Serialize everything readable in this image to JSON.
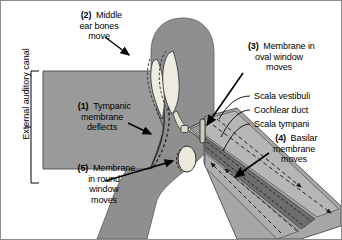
{
  "figure": {
    "background": "#ffffff",
    "border_color": "#8d8d8d",
    "width": 342,
    "height": 240
  },
  "colors": {
    "head_gray": "#8f8f8f",
    "canal_gray": "#9a9a9a",
    "bone_cream": "#e8e5da",
    "cochlea_light": "#9e9e9e",
    "cochlear_duct_dark": "#6e6e6e",
    "scala_mid": "#b4b4b4",
    "outline": "#3a3a3a",
    "text": "#000000"
  },
  "bracket": {
    "label": "External auditory canal",
    "orientation": "vertical"
  },
  "callouts": [
    {
      "id": "tympanic-membrane",
      "number": "(1)",
      "lines": [
        "Tympanic",
        "membrane",
        "deflects"
      ],
      "align": "center"
    },
    {
      "id": "middle-ear-bones",
      "number": "(2)",
      "lines": [
        "Middle",
        "ear bones",
        "move"
      ],
      "align": "center"
    },
    {
      "id": "oval-window",
      "number": "(3)",
      "lines": [
        "Membrane in",
        "oval window",
        "moves"
      ],
      "align": "center"
    },
    {
      "id": "basilar-membrane",
      "number": "(4)",
      "lines": [
        "Basilar",
        "membrane",
        "moves"
      ],
      "align": "center"
    },
    {
      "id": "round-window",
      "number": "(5)",
      "lines": [
        "Membrane",
        "in round",
        "window",
        "moves"
      ],
      "align": "center"
    }
  ],
  "leader_labels": [
    {
      "id": "scala-vestibuli",
      "text": "Scala vestibuli"
    },
    {
      "id": "cochlear-duct",
      "text": "Cochlear duct"
    },
    {
      "id": "scala-tympani",
      "text": "Scala tympani"
    }
  ]
}
